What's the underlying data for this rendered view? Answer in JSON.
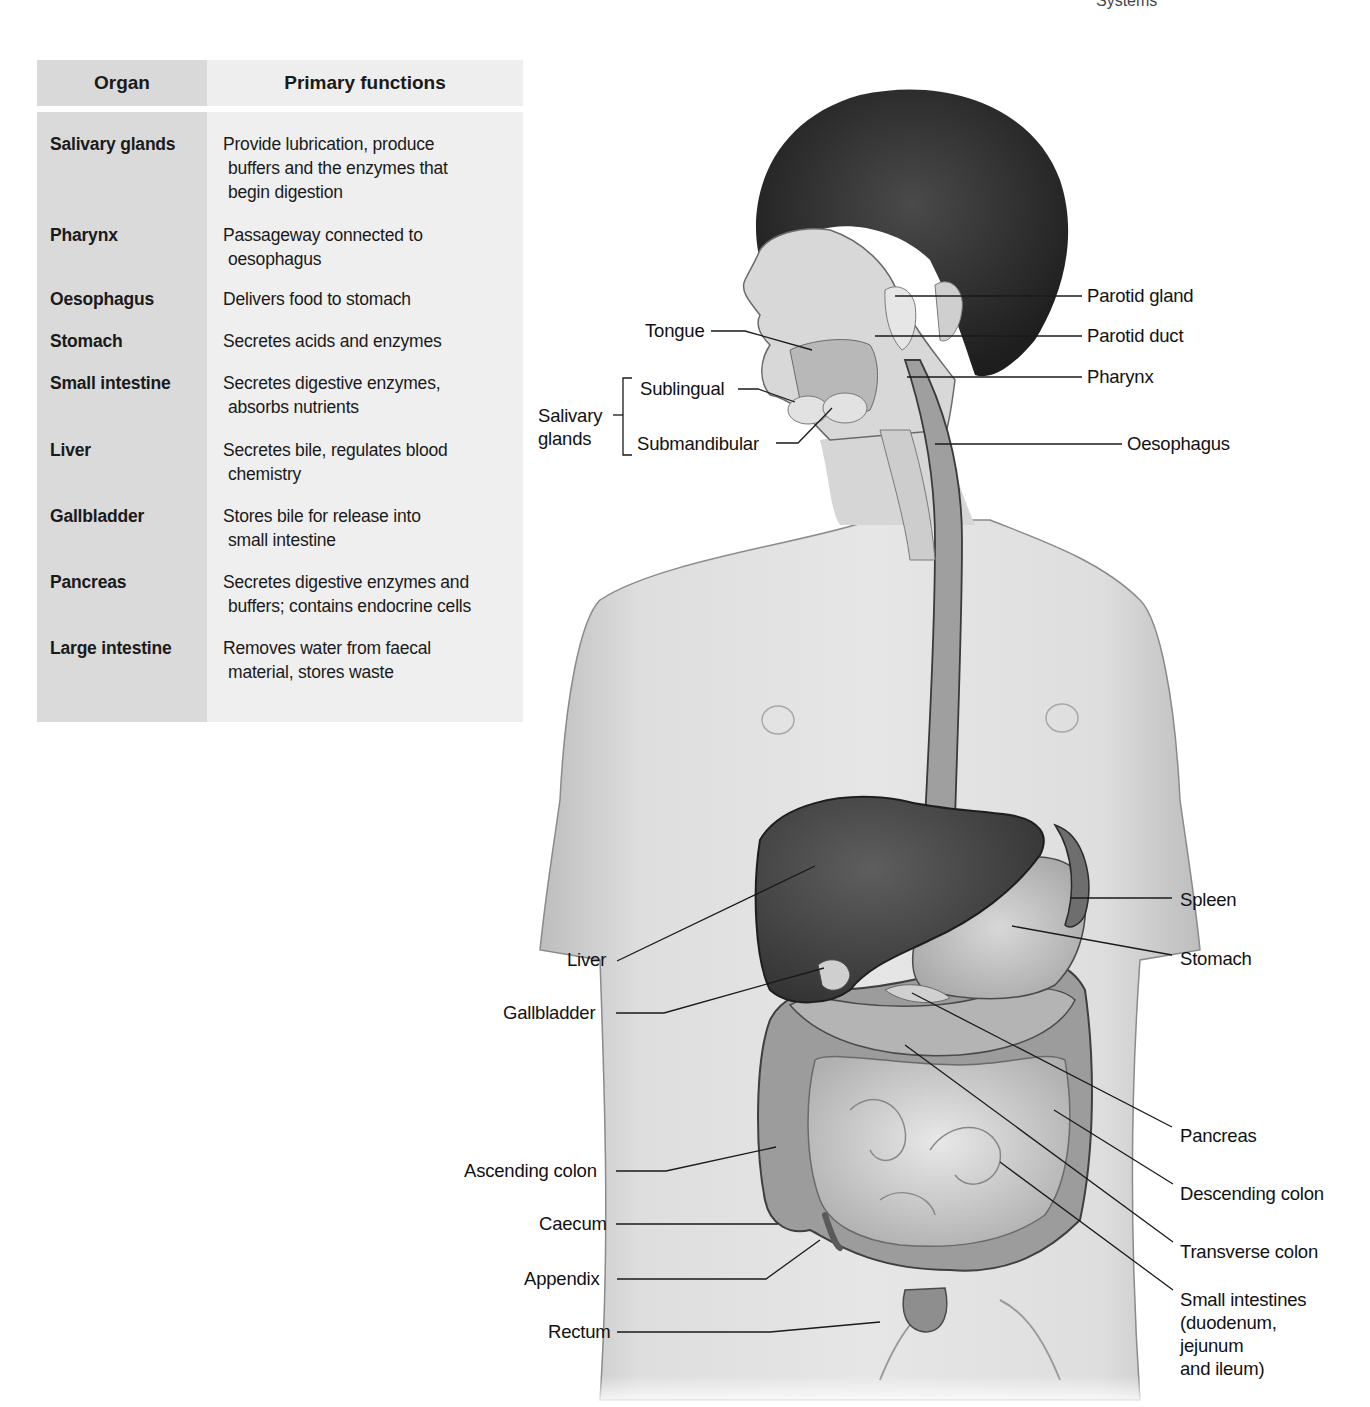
{
  "running_head": {
    "left_fragment": "Systems",
    "right_fragment": ""
  },
  "table": {
    "headers": {
      "organ": "Organ",
      "functions": "Primary functions"
    },
    "rows": [
      {
        "organ": "Salivary glands",
        "function_lines": [
          "Provide lubrication, produce",
          "buffers and the enzymes that",
          "begin digestion"
        ]
      },
      {
        "organ": "Pharynx",
        "function_lines": [
          "Passageway connected to",
          "oesophagus"
        ]
      },
      {
        "organ": "Oesophagus",
        "function_lines": [
          "Delivers food to stomach"
        ]
      },
      {
        "organ": "Stomach",
        "function_lines": [
          "Secretes acids and enzymes"
        ]
      },
      {
        "organ": "Small intestine",
        "function_lines": [
          "Secretes digestive enzymes,",
          "absorbs nutrients"
        ]
      },
      {
        "organ": "Liver",
        "function_lines": [
          "Secretes bile, regulates blood",
          "chemistry"
        ]
      },
      {
        "organ": "Gallbladder",
        "function_lines": [
          "Stores bile for release into",
          "small intestine"
        ]
      },
      {
        "organ": "Pancreas",
        "function_lines": [
          "Secretes digestive enzymes and",
          "buffers; contains endocrine cells"
        ]
      },
      {
        "organ": "Large intestine",
        "function_lines": [
          "Removes water from faecal",
          "material, stores waste"
        ]
      }
    ]
  },
  "figure": {
    "labels_left": {
      "tongue": "Tongue",
      "salivary_glands_line1": "Salivary",
      "salivary_glands_line2": "glands",
      "sublingual": "Sublingual",
      "submandibular": "Submandibular",
      "liver": "Liver",
      "gallbladder": "Gallbladder",
      "ascending_colon": "Ascending colon",
      "caecum": "Caecum",
      "appendix": "Appendix",
      "rectum": "Rectum"
    },
    "labels_right": {
      "parotid_gland": "Parotid gland",
      "parotid_duct": "Parotid duct",
      "pharynx": "Pharynx",
      "oesophagus": "Oesophagus",
      "spleen": "Spleen",
      "stomach": "Stomach",
      "pancreas": "Pancreas",
      "descending_colon": "Descending colon",
      "transverse_colon": "Transverse colon",
      "small_intestines_lines": [
        "Small intestines",
        "(duodenum,",
        "jejunum",
        "and ileum)"
      ]
    },
    "colors": {
      "skin": "#d4d4d4",
      "hair": "#2a2a2a",
      "liver": "#4a4a4a",
      "organ_light": "#c8c8c8",
      "intestine": "#b5b5b5",
      "leader_line": "#1a1a1a"
    }
  }
}
